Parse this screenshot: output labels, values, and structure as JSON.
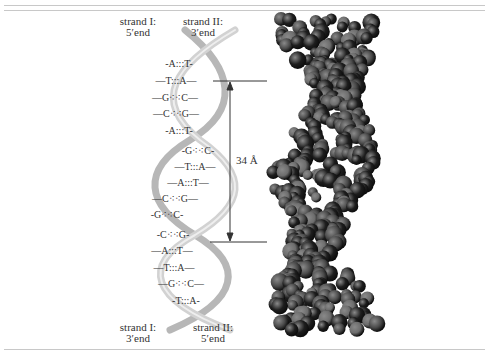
{
  "figure": {
    "top_labels": [
      {
        "line1": "strand I:",
        "line2": "5′end"
      },
      {
        "line1": "strand II:",
        "line2": "3′end"
      }
    ],
    "bottom_labels": [
      {
        "line1": "strand I:",
        "line2": "3′end"
      },
      {
        "line1": "strand II:",
        "line2": "5′end"
      }
    ],
    "scale_label": "34 Å",
    "base_pairs": [
      {
        "left": "A",
        "bond": ":::",
        "right": "T"
      },
      {
        "left": "T",
        "bond": ":::",
        "right": "A"
      },
      {
        "left": "G",
        "bond": "⁖⁖",
        "right": "C"
      },
      {
        "left": "C",
        "bond": "⁖⁖",
        "right": "G"
      },
      {
        "left": "A",
        "bond": ":::",
        "right": "T"
      },
      {
        "left": "G",
        "bond": "⁖⁖",
        "right": "C"
      },
      {
        "left": "T",
        "bond": ":::",
        "right": "A"
      },
      {
        "left": "A",
        "bond": ":::",
        "right": "T"
      },
      {
        "left": "C",
        "bond": "⁖⁖",
        "right": "G"
      },
      {
        "left": "G",
        "bond": "⁖⁖",
        "right": "C"
      },
      {
        "left": "C",
        "bond": "⁖⁖",
        "right": "G"
      },
      {
        "left": "A",
        "bond": ":::",
        "right": "T"
      },
      {
        "left": "T",
        "bond": ":::",
        "right": "A"
      },
      {
        "left": "G",
        "bond": "⁖⁖",
        "right": "C"
      },
      {
        "left": "T",
        "bond": ":::",
        "right": "A"
      }
    ],
    "colors": {
      "ribbon": "#c9c9c9",
      "ribbon_shadow": "#a9a9a9",
      "atom_dark": "#1e1e1e",
      "atom_mid": "#4a4a4a",
      "atom_light": "#6d6d6d",
      "rule": "#c8c8c8"
    }
  }
}
